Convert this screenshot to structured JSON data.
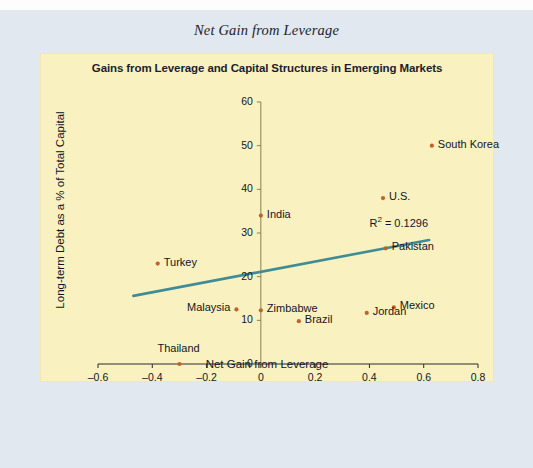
{
  "figure": {
    "caption": "Net Gain from Leverage"
  },
  "chart_data": {
    "type": "scatter",
    "title": "Gains from Leverage and Capital Structures in Emerging Markets",
    "xlabel": "Net Gain from Leverage",
    "ylabel": "Long-term Debt as a % of Total Capital",
    "xlim": [
      -0.6,
      0.8
    ],
    "ylim": [
      0,
      60
    ],
    "xticks": [
      "–0.6",
      "–0.4",
      "–0.2",
      "0",
      "0.2",
      "0.4",
      "0.6",
      "0.8"
    ],
    "xtick_values": [
      -0.6,
      -0.4,
      -0.2,
      0,
      0.2,
      0.4,
      0.6,
      0.8
    ],
    "yticks": [
      "0",
      "10",
      "20",
      "30",
      "40",
      "50",
      "60"
    ],
    "ytick_values": [
      0,
      10,
      20,
      30,
      40,
      50,
      60
    ],
    "grid": false,
    "legend": "none",
    "marker_color": "#c0622a",
    "trendline_color": "#3f8c96",
    "plot_background": "#f9f2c0",
    "annotation": "R² = 0.1296",
    "annotation_value": 0.1296,
    "trendline": {
      "x_start": -0.47,
      "y_start": 15.6,
      "x_end": 0.62,
      "y_end": 28.4
    },
    "points": [
      {
        "label": "South Korea",
        "x": 0.63,
        "y": 50.0,
        "label_side": "right"
      },
      {
        "label": "U.S.",
        "x": 0.45,
        "y": 38.0,
        "label_side": "right"
      },
      {
        "label": "India",
        "x": 0.0,
        "y": 34.0,
        "label_side": "right"
      },
      {
        "label": "Pakistan",
        "x": 0.46,
        "y": 26.5,
        "label_side": "right"
      },
      {
        "label": "Turkey",
        "x": -0.38,
        "y": 23.0,
        "label_side": "right"
      },
      {
        "label": "Malaysia",
        "x": -0.09,
        "y": 12.5,
        "label_side": "left"
      },
      {
        "label": "Zimbabwe",
        "x": 0.0,
        "y": 12.3,
        "label_side": "right"
      },
      {
        "label": "Mexico",
        "x": 0.49,
        "y": 13.0,
        "label_side": "right"
      },
      {
        "label": "Jordan",
        "x": 0.39,
        "y": 11.7,
        "label_side": "right"
      },
      {
        "label": "Brazil",
        "x": 0.14,
        "y": 9.8,
        "label_side": "right"
      },
      {
        "label": "Thailand",
        "x": -0.3,
        "y": 0.0,
        "label_side": "above"
      }
    ]
  }
}
